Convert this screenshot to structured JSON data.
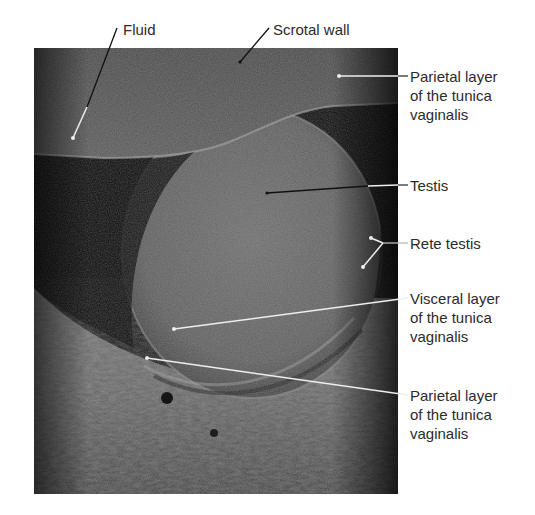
{
  "figure": {
    "type": "labeled ultrasound image"
  },
  "labels": {
    "fluid": "Fluid",
    "scrotal_wall": "Scrotal wall",
    "parietal_top": [
      "Parietal layer",
      "of the tunica",
      "vaginalis"
    ],
    "testis": "Testis",
    "rete_testis": "Rete testis",
    "visceral": [
      "Visceral layer",
      "of the tunica",
      "vaginalis"
    ],
    "parietal_bottom": [
      "Parietal layer",
      "of the tunica",
      "vaginalis"
    ]
  },
  "colors": {
    "background": "#ffffff",
    "label_text": "#2b2b2b",
    "leader_dark": "#111111",
    "leader_light": "#f2f2f2"
  }
}
